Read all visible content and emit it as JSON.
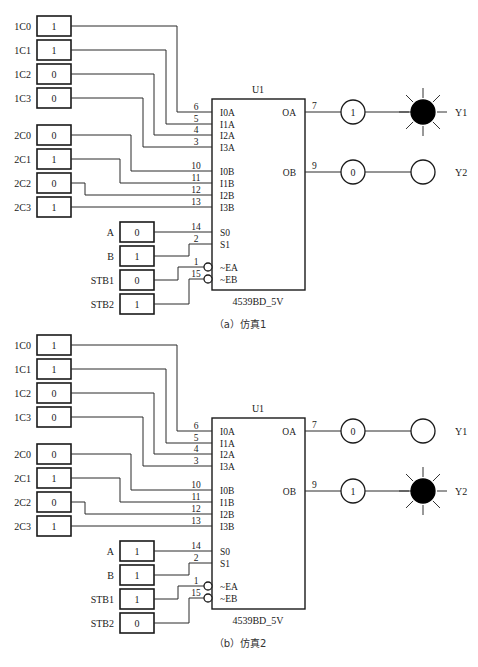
{
  "circuits": [
    {
      "id": "a",
      "caption": "（a）仿真1",
      "chip": {
        "ref": "U1",
        "part": "4539BD_5V",
        "pins_left": [
          {
            "label": "I0A",
            "num": "6"
          },
          {
            "label": "I1A",
            "num": "5"
          },
          {
            "label": "I2A",
            "num": "4"
          },
          {
            "label": "I3A",
            "num": "3"
          },
          {
            "label": "I0B",
            "num": "10"
          },
          {
            "label": "I1B",
            "num": "11"
          },
          {
            "label": "I2B",
            "num": "12"
          },
          {
            "label": "I3B",
            "num": "13"
          },
          {
            "label": "S0",
            "num": "14"
          },
          {
            "label": "S1",
            "num": "2"
          },
          {
            "label": "~EA",
            "num": "1"
          },
          {
            "label": "~EB",
            "num": "15"
          }
        ],
        "pins_right": [
          {
            "label": "OA",
            "num": "7"
          },
          {
            "label": "OB",
            "num": "9"
          }
        ]
      },
      "inputs": [
        {
          "name": "1C0",
          "value": "1"
        },
        {
          "name": "1C1",
          "value": "1"
        },
        {
          "name": "1C2",
          "value": "0"
        },
        {
          "name": "1C3",
          "value": "0"
        },
        {
          "name": "2C0",
          "value": "0"
        },
        {
          "name": "2C1",
          "value": "1"
        },
        {
          "name": "2C2",
          "value": "0"
        },
        {
          "name": "2C3",
          "value": "1"
        },
        {
          "name": "A",
          "value": "0"
        },
        {
          "name": "B",
          "value": "1"
        },
        {
          "name": "STB1",
          "value": "0"
        },
        {
          "name": "STB2",
          "value": "1"
        }
      ],
      "outputs": [
        {
          "name": "Y1",
          "probe": "1",
          "lit": true
        },
        {
          "name": "Y2",
          "probe": "0",
          "lit": false
        }
      ]
    },
    {
      "id": "b",
      "caption": "（b）仿真2",
      "chip": {
        "ref": "U1",
        "part": "4539BD_5V",
        "pins_left": [
          {
            "label": "I0A",
            "num": "6"
          },
          {
            "label": "I1A",
            "num": "5"
          },
          {
            "label": "I2A",
            "num": "4"
          },
          {
            "label": "I3A",
            "num": "3"
          },
          {
            "label": "I0B",
            "num": "10"
          },
          {
            "label": "I1B",
            "num": "11"
          },
          {
            "label": "I2B",
            "num": "12"
          },
          {
            "label": "I3B",
            "num": "13"
          },
          {
            "label": "S0",
            "num": "14"
          },
          {
            "label": "S1",
            "num": "2"
          },
          {
            "label": "~EA",
            "num": "1"
          },
          {
            "label": "~EB",
            "num": "15"
          }
        ],
        "pins_right": [
          {
            "label": "OA",
            "num": "7"
          },
          {
            "label": "OB",
            "num": "9"
          }
        ]
      },
      "inputs": [
        {
          "name": "1C0",
          "value": "1"
        },
        {
          "name": "1C1",
          "value": "1"
        },
        {
          "name": "1C2",
          "value": "0"
        },
        {
          "name": "1C3",
          "value": "0"
        },
        {
          "name": "2C0",
          "value": "0"
        },
        {
          "name": "2C1",
          "value": "1"
        },
        {
          "name": "2C2",
          "value": "0"
        },
        {
          "name": "2C3",
          "value": "1"
        },
        {
          "name": "A",
          "value": "1"
        },
        {
          "name": "B",
          "value": "1"
        },
        {
          "name": "STB1",
          "value": "1"
        },
        {
          "name": "STB2",
          "value": "0"
        }
      ],
      "outputs": [
        {
          "name": "Y1",
          "probe": "0",
          "lit": false
        },
        {
          "name": "Y2",
          "probe": "1",
          "lit": true
        }
      ]
    }
  ]
}
